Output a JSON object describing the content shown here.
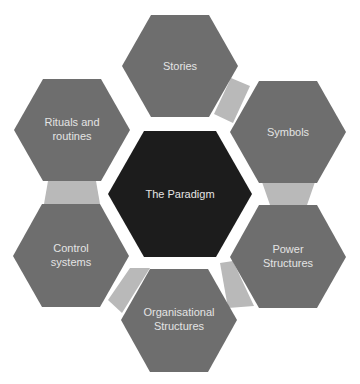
{
  "diagram": {
    "center": {
      "label": "The Paradigm",
      "color": "#1c1c1c"
    },
    "nodes": [
      {
        "id": "stories",
        "lines": [
          "Stories"
        ]
      },
      {
        "id": "symbols",
        "lines": [
          "Symbols"
        ]
      },
      {
        "id": "power-structures",
        "lines": [
          "Power",
          "Structures"
        ]
      },
      {
        "id": "organisational-structures",
        "lines": [
          "Organisational",
          "Structures"
        ]
      },
      {
        "id": "control-systems",
        "lines": [
          "Control",
          "systems"
        ]
      },
      {
        "id": "rituals-and-routines",
        "lines": [
          "Rituals and",
          "routines"
        ]
      }
    ],
    "colors": {
      "node": "#6e6e6e",
      "connector": "#b9b9b9",
      "text": "#e4e4e4"
    }
  }
}
